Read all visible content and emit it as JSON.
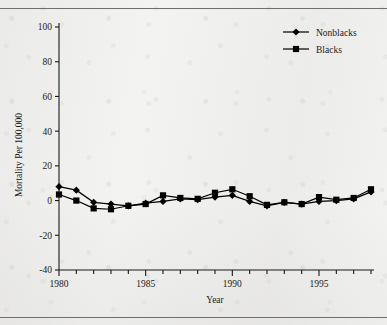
{
  "page": {
    "rule_top": "horizontal-rule",
    "rule_bottom": "horizontal-rule"
  },
  "chart_data": {
    "type": "line",
    "title": "",
    "xlabel": "Year",
    "ylabel": "Mortality Per 100,000",
    "xlim": [
      1980,
      1998
    ],
    "ylim": [
      -40,
      100
    ],
    "ytick_values": [
      -40,
      -20,
      0,
      20,
      40,
      60,
      80,
      100
    ],
    "ytick_labels": [
      "-40",
      "-20",
      "0",
      "20",
      "40",
      "60",
      "80",
      "100"
    ],
    "xtick_values": [
      1980,
      1981,
      1982,
      1983,
      1984,
      1985,
      1986,
      1987,
      1988,
      1989,
      1990,
      1991,
      1992,
      1993,
      1994,
      1995,
      1996,
      1997,
      1998
    ],
    "xtick_labels_major": [
      "1980",
      "1985",
      "1990",
      "1995"
    ],
    "xtick_major_values": [
      1980,
      1985,
      1990,
      1995
    ],
    "grid": false,
    "legend_position": "top-right",
    "x": [
      1980,
      1981,
      1982,
      1983,
      1984,
      1985,
      1986,
      1987,
      1988,
      1989,
      1990,
      1991,
      1992,
      1993,
      1994,
      1995,
      1996,
      1997,
      1998
    ],
    "series": [
      {
        "name": "Nonblacks",
        "marker": "diamond",
        "color": "#000000",
        "values": [
          8,
          6,
          -1,
          -2,
          -3,
          -1.5,
          -0.5,
          1,
          0.5,
          2,
          3,
          -0.5,
          -3,
          -1,
          -2,
          -0.5,
          0,
          1,
          5
        ]
      },
      {
        "name": "Blacks",
        "marker": "square",
        "color": "#000000",
        "values": [
          3.5,
          0,
          -4.5,
          -5,
          -3,
          -2,
          3,
          1.5,
          1,
          4.5,
          6.5,
          2.5,
          -2.5,
          -1,
          -2,
          2,
          0.5,
          1.5,
          6.5
        ]
      }
    ]
  },
  "legend": {
    "items": [
      {
        "label": "Nonblacks",
        "marker": "diamond"
      },
      {
        "label": "Blacks",
        "marker": "square"
      }
    ]
  }
}
